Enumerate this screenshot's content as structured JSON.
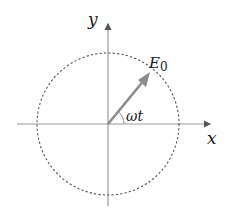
{
  "diagram": {
    "type": "phasor-rotating-vector",
    "labels": {
      "y_axis": "y",
      "x_axis": "x",
      "vector": "E",
      "vector_subscript": "0",
      "angle": "ωt"
    },
    "colors": {
      "axis": "#9a9a9a",
      "circle": "#555555",
      "vector": "#8c8c8c",
      "text": "#1a1a1a"
    },
    "geometry": {
      "center": [
        108,
        124
      ],
      "radius": 71,
      "vector_angle_deg": 50
    }
  }
}
